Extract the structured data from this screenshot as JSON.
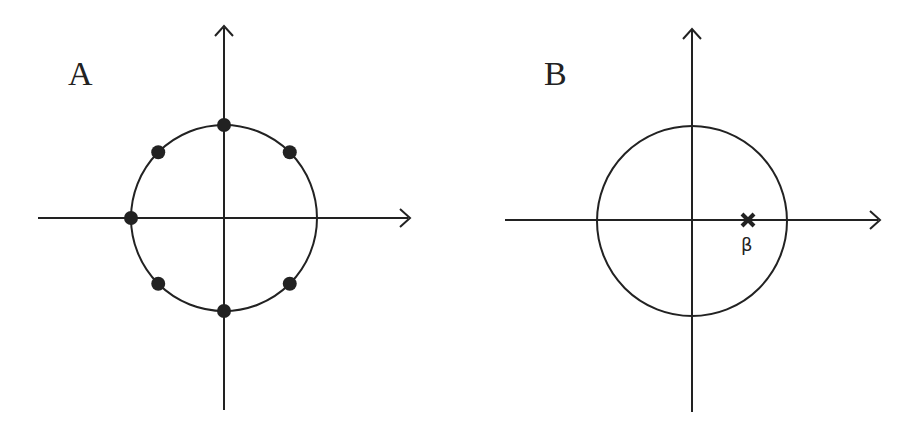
{
  "panels": [
    {
      "label": "A",
      "description": "Unit circle with 7 marked points (8th-roots pattern missing the positive real axis point)",
      "points": [
        {
          "angle_deg": 45
        },
        {
          "angle_deg": 90
        },
        {
          "angle_deg": 135
        },
        {
          "angle_deg": 180
        },
        {
          "angle_deg": 225
        },
        {
          "angle_deg": 270
        },
        {
          "angle_deg": 315
        }
      ]
    },
    {
      "label": "B",
      "description": "Unit circle with a single cross marker on the positive real axis inside the circle",
      "marker": {
        "symbol": "✖",
        "label": "β",
        "position_fraction_of_radius": 0.6
      }
    }
  ],
  "colors": {
    "stroke": "#222222",
    "background": "#ffffff"
  }
}
